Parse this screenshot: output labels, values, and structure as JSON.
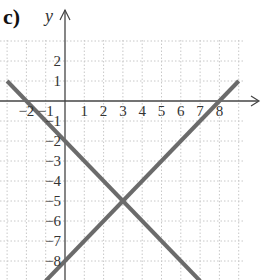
{
  "part_label": "c)",
  "chart_data": {
    "type": "line",
    "title": "",
    "xlabel": "x",
    "ylabel": "y",
    "xlim": [
      -3,
      9
    ],
    "ylim": [
      -9,
      3
    ],
    "grid": true,
    "grid_style": "dotted",
    "x_ticks": [
      -2,
      -1,
      1,
      2,
      3,
      4,
      5,
      6,
      7,
      8
    ],
    "x_tick_labels": [
      "−2",
      "−1",
      "1",
      "2",
      "3",
      "4",
      "5",
      "6",
      "7",
      "8"
    ],
    "y_ticks": [
      2,
      1,
      -1,
      -2,
      -3,
      -4,
      -5,
      -6,
      -7,
      -8
    ],
    "y_tick_labels": [
      "2",
      "1",
      "−1",
      "−2",
      "−3",
      "−4",
      "−5",
      "−6",
      "−7",
      "−8"
    ],
    "series": [
      {
        "name": "y = -x - 2",
        "x": [
          -3,
          7
        ],
        "y": [
          1,
          -9
        ],
        "color": "#6b6b6b"
      },
      {
        "name": "y = x - 8",
        "x": [
          -1,
          9
        ],
        "y": [
          -9,
          1
        ],
        "color": "#6b6b6b"
      }
    ],
    "intersection": {
      "x": 3,
      "y": -5
    }
  }
}
